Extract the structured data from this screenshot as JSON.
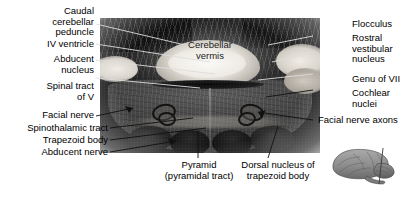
{
  "figure": {
    "modality": "grayscale histological section photograph",
    "background_color": "#ffffff",
    "text_color": "#000000",
    "leader_line_color_on_specimen": "#d8d8d8",
    "leader_line_color_on_page": "#000000"
  },
  "labels_left": [
    {
      "id": "caudal-cerebellar-peduncle",
      "text": "Caudal\ncerebellar\npeduncle"
    },
    {
      "id": "iv-ventricle",
      "text": "IV ventricle"
    },
    {
      "id": "abducent-nucleus",
      "text": "Abducent\nnucleus"
    },
    {
      "id": "spinal-tract-of-v",
      "text": "Spinal tract\nof V"
    },
    {
      "id": "facial-nerve",
      "text": "Facial nerve"
    },
    {
      "id": "spinothalamic-tract",
      "text": "Spinothalamic tract"
    },
    {
      "id": "trapezoid-body",
      "text": "Trapezoid body"
    },
    {
      "id": "abducent-nerve",
      "text": "Abducent nerve"
    }
  ],
  "labels_right": [
    {
      "id": "flocculus",
      "text": "Flocculus"
    },
    {
      "id": "rostral-vestibular-nucleus",
      "text": "Rostral\nvestibular\nnucleus"
    },
    {
      "id": "genu-of-vii",
      "text": "Genu of VII"
    },
    {
      "id": "cochlear-nuclei",
      "text": "Cochlear\nnuclei"
    },
    {
      "id": "facial-nerve-axons",
      "text": "Facial nerve axons"
    }
  ],
  "labels_center": [
    {
      "id": "cerebellar-vermis",
      "text": "Cerebellar\nvermis"
    }
  ],
  "labels_bottom": [
    {
      "id": "pyramid",
      "text": "Pyramid\n(pyramidal tract)"
    },
    {
      "id": "dorsal-nucleus-of-trapezoid-body",
      "text": "Dorsal nucleus of\ntrapezoid body"
    }
  ],
  "inset": {
    "id": "brain-lateral-inset",
    "description": "small lateral view of the brain with a vertical line marking the plane of section"
  }
}
